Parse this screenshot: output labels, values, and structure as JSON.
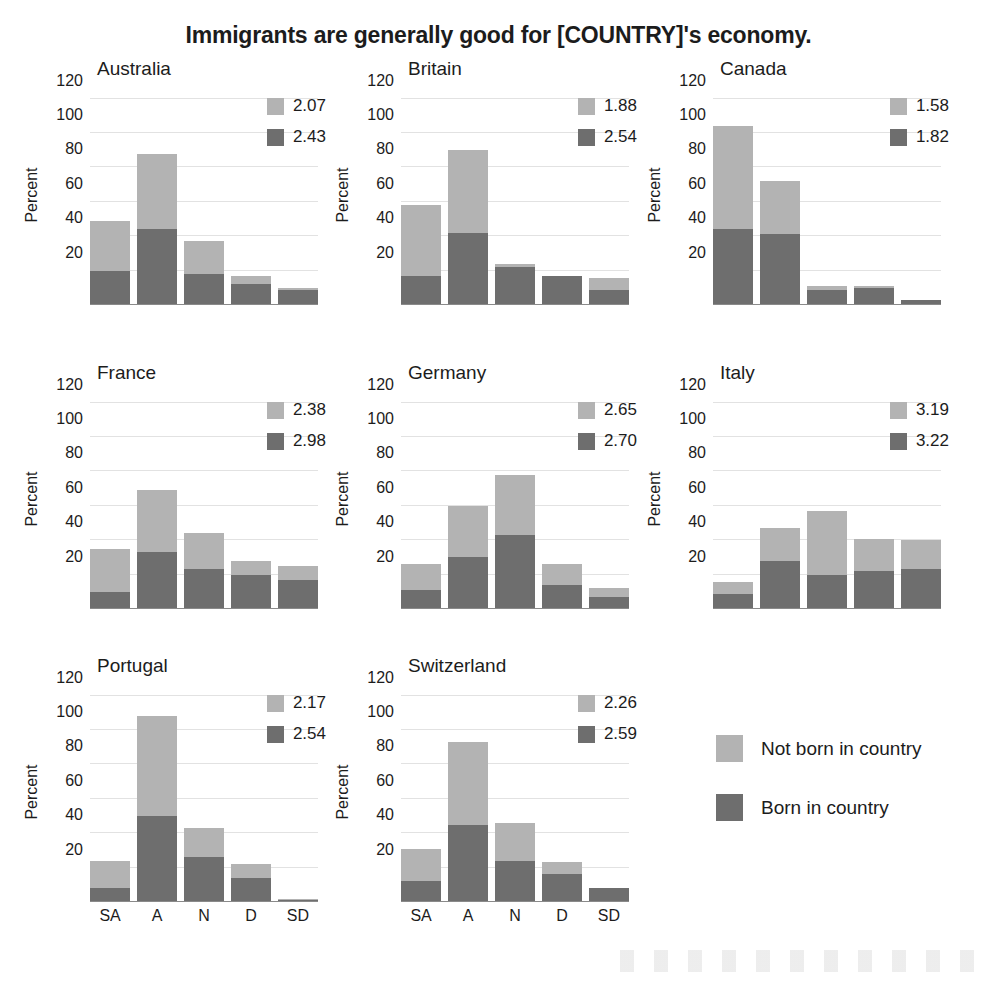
{
  "chart_data": {
    "type": "bar",
    "subtype": "stacked-bar small-multiples",
    "title": "Immigrants are generally good for [COUNTRY]'s economy.",
    "xlabel": "",
    "ylabel": "Percent",
    "categories": [
      "SA",
      "A",
      "N",
      "D",
      "SD"
    ],
    "ylim": [
      0,
      125
    ],
    "yticks": [
      20,
      40,
      60,
      80,
      100,
      120
    ],
    "grid": true,
    "legend_position": "bottom-right",
    "series": [
      {
        "name": "Not born in country",
        "color": "#b3b3b3"
      },
      {
        "name": "Born in country",
        "color": "#6e6e6e"
      }
    ],
    "panels": [
      {
        "name": "Australia",
        "mean_not_born": "2.07",
        "mean_born": "2.43",
        "born_in_country": [
          20,
          44,
          18,
          12,
          9
        ],
        "not_born_in_country": [
          29,
          44,
          19,
          5,
          1
        ],
        "totals": [
          49,
          88,
          37,
          17,
          10
        ]
      },
      {
        "name": "Britain",
        "mean_not_born": "1.88",
        "mean_born": "2.54",
        "born_in_country": [
          17,
          42,
          22,
          17,
          9
        ],
        "not_born_in_country": [
          41,
          48,
          2,
          0,
          7
        ],
        "totals": [
          58,
          90,
          24,
          17,
          16
        ]
      },
      {
        "name": "Canada",
        "mean_not_born": "1.58",
        "mean_born": "1.82",
        "born_in_country": [
          44,
          41,
          9,
          10,
          3
        ],
        "not_born_in_country": [
          60,
          31,
          2,
          1,
          0
        ],
        "totals": [
          104,
          72,
          11,
          11,
          3
        ]
      },
      {
        "name": "France",
        "mean_not_born": "2.38",
        "mean_born": "2.98",
        "born_in_country": [
          10,
          33,
          23,
          20,
          17
        ],
        "not_born_in_country": [
          25,
          36,
          21,
          8,
          8
        ],
        "totals": [
          35,
          69,
          44,
          28,
          25
        ]
      },
      {
        "name": "Germany",
        "mean_not_born": "2.65",
        "mean_born": "2.70",
        "born_in_country": [
          11,
          30,
          43,
          14,
          7
        ],
        "not_born_in_country": [
          15,
          30,
          35,
          12,
          5
        ],
        "totals": [
          26,
          60,
          78,
          26,
          12
        ]
      },
      {
        "name": "Italy",
        "mean_not_born": "3.19",
        "mean_born": "3.22",
        "born_in_country": [
          9,
          28,
          20,
          22,
          23
        ],
        "not_born_in_country": [
          7,
          19,
          37,
          19,
          17
        ],
        "totals": [
          16,
          47,
          57,
          41,
          40
        ]
      },
      {
        "name": "Portugal",
        "mean_not_born": "2.17",
        "mean_born": "2.54",
        "born_in_country": [
          8,
          50,
          26,
          14,
          1
        ],
        "not_born_in_country": [
          16,
          58,
          17,
          8,
          1
        ],
        "totals": [
          24,
          108,
          43,
          22,
          2
        ]
      },
      {
        "name": "Switzerland",
        "mean_not_born": "2.26",
        "mean_born": "2.59",
        "born_in_country": [
          12,
          45,
          24,
          16,
          8
        ],
        "not_born_in_country": [
          19,
          48,
          22,
          7,
          0
        ],
        "totals": [
          31,
          93,
          46,
          23,
          8
        ]
      }
    ]
  }
}
